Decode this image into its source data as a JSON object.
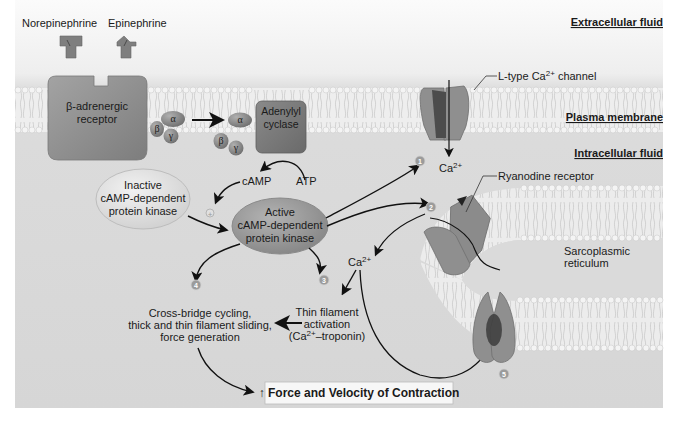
{
  "regions": {
    "extracellular": "Extracellular fluid",
    "plasma_membrane": "Plasma membrane",
    "intracellular": "Intracellular fluid",
    "sarcoplasmic_reticulum": [
      "Sarcoplasmic",
      "reticulum"
    ]
  },
  "ligands": {
    "norepinephrine": "Norepinephrine",
    "epinephrine": "Epinephrine"
  },
  "receptor": [
    "β-adrenergic",
    "receptor"
  ],
  "g_protein": {
    "alpha": "α",
    "beta": "β",
    "gamma": "γ"
  },
  "adenylyl_cyclase": [
    "Adenylyl",
    "cyclase"
  ],
  "second_messenger": {
    "camp": "cAMP",
    "atp": "ATP",
    "activation_symbol": "+"
  },
  "pka_inactive": [
    "Inactive",
    "cAMP-dependent",
    "protein kinase"
  ],
  "pka_active": [
    "Active",
    "cAMP-dependent",
    "protein kinase"
  ],
  "channels": {
    "l_type": {
      "prefix": "L-type Ca",
      "sup": "2+",
      "suffix": " channel"
    },
    "ryanodine": "Ryanodine receptor"
  },
  "calcium": {
    "base": "Ca",
    "sup": "2+"
  },
  "steps": [
    "1",
    "2",
    "3",
    "4",
    "5"
  ],
  "crossbridge": [
    "Cross-bridge cycling,",
    "thick and thin filament sliding,",
    "force generation"
  ],
  "thin_filament": {
    "line1": "Thin filament",
    "line2": "activation",
    "line3_prefix": "(Ca",
    "line3_sup": "2+",
    "line3_suffix": "–troponin)"
  },
  "result": {
    "arrow": "↑",
    "text": " Force and Velocity of Contraction"
  },
  "colors": {
    "background": "#d9d9d9",
    "extracellular_top": "#f4f4f4",
    "protein": "#8c8c8c",
    "protein_dark": "#5e5e5e",
    "pka_active": "#9a9a9a",
    "pka_inactive": "#e6e6e6",
    "step_circle": "#9b9b9b"
  }
}
